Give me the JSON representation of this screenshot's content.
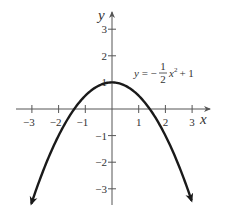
{
  "chart_data": {
    "type": "line",
    "title": "",
    "function": "y = -1/2 x^2 + 1",
    "equation_label": {
      "prefix": "y = −",
      "num": "1",
      "den": "2",
      "var": "x",
      "exp": "2",
      "suffix": "+ 1"
    },
    "xlabel": "x",
    "ylabel": "y",
    "xlim": [
      -3.5,
      3.5
    ],
    "ylim": [
      -3.5,
      3.5
    ],
    "x_ticks": [
      "-3",
      "-2",
      "-1",
      "1",
      "2",
      "3"
    ],
    "y_ticks": [
      "3",
      "2",
      "1",
      "-1",
      "-2",
      "-3"
    ],
    "x_tick_values": [
      -3,
      -2,
      -1,
      1,
      2,
      3
    ],
    "y_tick_values": [
      3,
      2,
      1,
      -1,
      -2,
      -3
    ],
    "grid": false,
    "series": [
      {
        "name": "y = -1/2 x^2 + 1",
        "x": [
          -3.05,
          -2.5,
          -2,
          -1.5,
          -1,
          -0.5,
          0,
          0.5,
          1,
          1.5,
          2,
          2.5,
          3.05
        ],
        "y": [
          -3.65,
          -2.125,
          -1,
          -0.125,
          0.5,
          0.875,
          1,
          0.875,
          0.5,
          -0.125,
          -1,
          -2.125,
          -3.65
        ]
      }
    ],
    "x_intercepts": [
      -1.414,
      1.414
    ],
    "vertex": [
      0,
      1
    ],
    "color": "#1a1a1a"
  }
}
